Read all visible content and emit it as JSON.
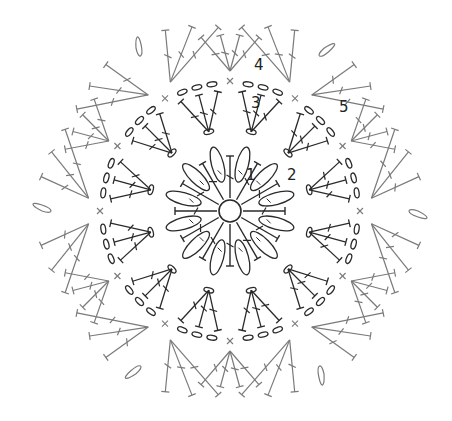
{
  "diagram": {
    "center": {
      "x": 230,
      "y": 211,
      "ring_radius": 11
    },
    "colors": {
      "inner": "#2a2a2a",
      "outer": "#7a7a7a",
      "background": "#ffffff"
    },
    "repeats": 12,
    "round_labels": [
      {
        "text": "1",
        "x": 246,
        "y": 168
      },
      {
        "text": "2",
        "x": 287,
        "y": 168
      },
      {
        "text": "3",
        "x": 251,
        "y": 96
      },
      {
        "text": "4",
        "x": 254,
        "y": 58
      },
      {
        "text": "5",
        "x": 339,
        "y": 100
      }
    ],
    "stitch_legend": {
      "ring": "magic-ring",
      "chain": "oval",
      "double_crochet": "T-with-bar",
      "single_crochet": "x",
      "slip_stitch": "dot"
    }
  }
}
